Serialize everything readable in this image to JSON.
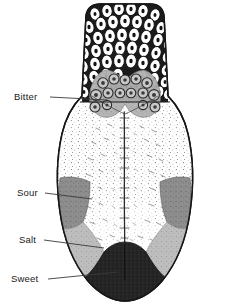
{
  "figure": {
    "background_color": "#ffffff",
    "outline_color": "#1a1a1a",
    "width": 229,
    "height": 304
  },
  "labels": [
    {
      "id": "bitter",
      "text": "Bitter",
      "text_x": 14,
      "text_y": 100,
      "leader_x1": 50,
      "leader_y1": 97,
      "leader_x2": 107,
      "leader_y2": 100,
      "region_color": "#9a9a9a"
    },
    {
      "id": "sour",
      "text": "Sour",
      "text_x": 17,
      "text_y": 196,
      "leader_x1": 45,
      "leader_y1": 193,
      "leader_x2": 92,
      "leader_y2": 199,
      "region_color": "#8d8d8d"
    },
    {
      "id": "salt",
      "text": "Salt",
      "text_x": 19,
      "text_y": 243,
      "leader_x1": 44,
      "leader_y1": 240,
      "leader_x2": 104,
      "leader_y2": 248,
      "region_color": "#b9b9b9"
    },
    {
      "id": "sweet",
      "text": "Sweet",
      "text_x": 11,
      "text_y": 282,
      "leader_x1": 48,
      "leader_y1": 279,
      "leader_x2": 118,
      "leader_y2": 272,
      "region_color": "#262626"
    }
  ],
  "regions": {
    "root_papillae": {
      "name": "root-papillae-field",
      "fill": "#ffffff",
      "stroke": "#111111",
      "description": "large rounded papillae cells with dark centers"
    },
    "circumvallate": {
      "name": "circumvallate-papillae",
      "fill": "#a8a8a8",
      "description": "V-shaped row of circumvallate papillae"
    },
    "body": {
      "name": "tongue-body",
      "fill": "#fdfdfd",
      "description": "stippled dorsal surface with median sulcus"
    },
    "median_sulcus": {
      "name": "median-sulcus",
      "stroke": "#2a2a2a"
    },
    "sour_left": {
      "fill": "#8d8d8d"
    },
    "sour_right": {
      "fill": "#8d8d8d"
    },
    "salt_left": {
      "fill": "#bdbdbd"
    },
    "salt_right": {
      "fill": "#bdbdbd"
    },
    "sweet_tip": {
      "fill": "#262626"
    }
  }
}
